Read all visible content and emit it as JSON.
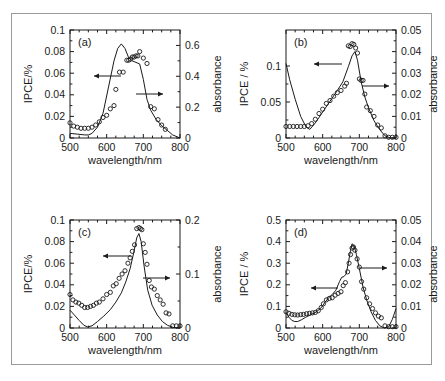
{
  "figure": {
    "kind": "multi-panel-scientific-figure",
    "panel_count": 4,
    "shared_xlabel": "wavelength/nm",
    "shared_xticks": [
      "500",
      "600",
      "700",
      "800"
    ],
    "marker_legend": "open circles = IPCE (left axis)",
    "line_legend": "solid curve = absorbance (right axis)"
  },
  "panels": {
    "a": {
      "letter": "(a)",
      "ylabel_left": "IPCE/%",
      "ylabel_right": "absorbance",
      "xlabel": "wavelength/nm",
      "left_ticks": [
        "0.02",
        "0.04",
        "0.06",
        "0.08",
        "0.1"
      ],
      "right_ticks": [
        "0",
        "0.2",
        "0.4",
        "0.6"
      ],
      "x_ticks": [
        "500",
        "600",
        "700",
        "800"
      ]
    },
    "b": {
      "letter": "(b)",
      "ylabel_left": "IPCE / %",
      "ylabel_right": "absorbance",
      "xlabel": "wavelength/nm",
      "left_ticks": [
        "0",
        "0.05",
        "0.1"
      ],
      "right_ticks": [
        "0",
        "0.01",
        "0.02",
        "0.03",
        "0.04",
        "0.05"
      ],
      "x_ticks": [
        "500",
        "600",
        "700",
        "800"
      ]
    },
    "c": {
      "letter": "(c)",
      "ylabel_left": "IPCE/%",
      "ylabel_right": "absorbance",
      "xlabel": "wavelength/nm",
      "left_ticks": [
        "0",
        "0.02",
        "0.04",
        "0.06",
        "0.08",
        "0.1"
      ],
      "right_ticks": [
        "0",
        "0.1",
        "0.2"
      ],
      "x_ticks": [
        "500",
        "600",
        "700",
        "800"
      ]
    },
    "d": {
      "letter": "(d)",
      "ylabel_left": "IPCE / %",
      "ylabel_right": "absorbance",
      "xlabel": "wavelength/nm",
      "left_ticks": [
        "0",
        "0.1",
        "0.2",
        "0.3",
        "0.4",
        "0.5"
      ],
      "right_ticks": [
        "0",
        "0.01",
        "0.02",
        "0.03",
        "0.04",
        "0.05"
      ],
      "x_ticks": [
        "500",
        "600",
        "700",
        "800"
      ]
    }
  },
  "chart_data": [
    {
      "id": "panel-a",
      "type": "scatter",
      "title": "(a)",
      "xlabel": "wavelength/nm",
      "ylabel": "IPCE/%",
      "ylabel_secondary": "absorbance",
      "xlim": [
        500,
        800
      ],
      "ylim": [
        0,
        0.1
      ],
      "ylim_secondary": [
        0,
        0.7
      ],
      "xticks": [
        500,
        600,
        700,
        800
      ],
      "yticks": [
        0,
        0.02,
        0.04,
        0.06,
        0.08,
        0.1
      ],
      "yticks_secondary": [
        0,
        0.2,
        0.4,
        0.6
      ],
      "grid": false,
      "legend": "none",
      "annotations": [
        {
          "text": "left-arrow to IPCE axis",
          "points_to": "left"
        },
        {
          "text": "right-arrow to absorbance axis",
          "points_to": "right"
        }
      ],
      "series": [
        {
          "name": "IPCE",
          "axis": "left",
          "style": "open-circle-markers",
          "x": [
            500,
            510,
            520,
            530,
            540,
            550,
            560,
            570,
            580,
            590,
            600,
            610,
            620,
            625,
            635,
            645,
            655,
            660,
            665,
            670,
            675,
            680,
            685,
            690,
            700,
            710,
            720,
            730,
            740,
            750,
            760
          ],
          "y": [
            0.014,
            0.011,
            0.01,
            0.009,
            0.009,
            0.009,
            0.01,
            0.012,
            0.015,
            0.019,
            0.021,
            0.027,
            0.03,
            0.045,
            0.061,
            0.061,
            0.072,
            0.072,
            0.073,
            0.075,
            0.075,
            0.076,
            0.076,
            0.08,
            0.074,
            0.069,
            0.029,
            0.027,
            0.017,
            0.012,
            0.008
          ]
        },
        {
          "name": "absorbance",
          "axis": "right",
          "style": "solid-line",
          "x": [
            500,
            520,
            540,
            550,
            560,
            575,
            590,
            605,
            620,
            630,
            640,
            650,
            660,
            670,
            680,
            690,
            700,
            710,
            720,
            735,
            750,
            765,
            780,
            800
          ],
          "y": [
            0.03,
            0.025,
            0.02,
            0.02,
            0.03,
            0.07,
            0.16,
            0.33,
            0.5,
            0.58,
            0.61,
            0.58,
            0.52,
            0.5,
            0.49,
            0.48,
            0.38,
            0.25,
            0.18,
            0.12,
            0.08,
            0.05,
            0.02,
            0.0
          ]
        }
      ]
    },
    {
      "id": "panel-b",
      "type": "scatter",
      "title": "(b)",
      "xlabel": "wavelength/nm",
      "ylabel": "IPCE / %",
      "ylabel_secondary": "absorbance",
      "xlim": [
        500,
        800
      ],
      "ylim": [
        0,
        0.15
      ],
      "ylim_secondary": [
        0,
        0.05
      ],
      "xticks": [
        500,
        600,
        700,
        800
      ],
      "yticks": [
        0,
        0.05,
        0.1
      ],
      "yticks_secondary": [
        0,
        0.01,
        0.02,
        0.03,
        0.04,
        0.05
      ],
      "grid": false,
      "legend": "none",
      "annotations": [
        {
          "text": "left-arrow to IPCE axis",
          "points_to": "left"
        },
        {
          "text": "right-arrow to absorbance axis",
          "points_to": "right"
        }
      ],
      "series": [
        {
          "name": "IPCE",
          "axis": "left",
          "style": "open-circle-markers",
          "x": [
            500,
            510,
            520,
            530,
            540,
            550,
            560,
            570,
            580,
            590,
            600,
            610,
            620,
            630,
            640,
            650,
            660,
            665,
            670,
            675,
            680,
            685,
            690,
            695,
            700,
            705,
            710,
            715,
            720,
            730,
            740,
            750,
            760,
            770,
            780,
            790,
            800
          ],
          "y": [
            0.016,
            0.016,
            0.016,
            0.016,
            0.016,
            0.016,
            0.017,
            0.02,
            0.026,
            0.034,
            0.04,
            0.048,
            0.052,
            0.058,
            0.063,
            0.066,
            0.072,
            0.076,
            0.128,
            0.127,
            0.131,
            0.13,
            0.125,
            0.118,
            0.082,
            0.08,
            0.08,
            0.061,
            0.043,
            0.038,
            0.03,
            0.018,
            0.014,
            0.003,
            0.001,
            0.001,
            0.001
          ]
        },
        {
          "name": "absorbance",
          "axis": "right",
          "style": "solid-line",
          "x": [
            500,
            510,
            525,
            540,
            555,
            565,
            580,
            600,
            620,
            640,
            655,
            670,
            680,
            688,
            695,
            705,
            715,
            725,
            740,
            755,
            770,
            785,
            800
          ],
          "y": [
            0.0345,
            0.027,
            0.018,
            0.01,
            0.005,
            0.004,
            0.007,
            0.012,
            0.017,
            0.022,
            0.026,
            0.033,
            0.038,
            0.04,
            0.036,
            0.026,
            0.019,
            0.014,
            0.008,
            0.004,
            0.001,
            0.0,
            0.0
          ]
        }
      ]
    },
    {
      "id": "panel-c",
      "type": "scatter",
      "title": "(c)",
      "xlabel": "wavelength/nm",
      "ylabel": "IPCE/%",
      "ylabel_secondary": "absorbance",
      "xlim": [
        500,
        800
      ],
      "ylim": [
        0,
        0.1
      ],
      "ylim_secondary": [
        0,
        0.2
      ],
      "xticks": [
        500,
        600,
        700,
        800
      ],
      "yticks": [
        0,
        0.02,
        0.04,
        0.06,
        0.08,
        0.1
      ],
      "yticks_secondary": [
        0,
        0.1,
        0.2
      ],
      "grid": false,
      "legend": "none",
      "annotations": [
        {
          "text": "left-arrow to IPCE axis",
          "points_to": "left"
        },
        {
          "text": "right-arrow to absorbance axis",
          "points_to": "right"
        }
      ],
      "series": [
        {
          "name": "IPCE",
          "axis": "left",
          "style": "open-circle-markers",
          "x": [
            500,
            508,
            516,
            524,
            532,
            540,
            548,
            556,
            564,
            572,
            580,
            590,
            600,
            610,
            618,
            626,
            634,
            642,
            650,
            658,
            664,
            670,
            676,
            682,
            688,
            692,
            696,
            700,
            705,
            710,
            716,
            722,
            730,
            738,
            746,
            754,
            762,
            770,
            780,
            790,
            800
          ],
          "y": [
            0.031,
            0.026,
            0.024,
            0.023,
            0.021,
            0.019,
            0.019,
            0.02,
            0.021,
            0.023,
            0.024,
            0.027,
            0.031,
            0.033,
            0.039,
            0.041,
            0.046,
            0.05,
            0.053,
            0.06,
            0.065,
            0.071,
            0.077,
            0.092,
            0.093,
            0.092,
            0.091,
            0.078,
            0.07,
            0.059,
            0.044,
            0.038,
            0.036,
            0.03,
            0.026,
            0.022,
            0.014,
            0.013,
            0.002,
            0.002,
            0.002
          ]
        },
        {
          "name": "absorbance",
          "axis": "right",
          "style": "solid-line",
          "x": [
            500,
            512,
            525,
            538,
            548,
            560,
            575,
            592,
            610,
            625,
            640,
            652,
            664,
            674,
            682,
            688,
            694,
            702,
            712,
            724,
            738,
            752,
            766,
            782,
            800
          ],
          "y": [
            0.033,
            0.024,
            0.014,
            0.005,
            0.002,
            0.004,
            0.012,
            0.022,
            0.034,
            0.048,
            0.065,
            0.085,
            0.11,
            0.14,
            0.167,
            0.175,
            0.16,
            0.115,
            0.07,
            0.042,
            0.024,
            0.012,
            0.005,
            0.001,
            0.0
          ]
        }
      ]
    },
    {
      "id": "panel-d",
      "type": "scatter",
      "title": "(d)",
      "xlabel": "wavelength/nm",
      "ylabel": "IPCE / %",
      "ylabel_secondary": "absorbance",
      "xlim": [
        500,
        800
      ],
      "ylim": [
        0,
        0.5
      ],
      "ylim_secondary": [
        0,
        0.05
      ],
      "xticks": [
        500,
        600,
        700,
        800
      ],
      "yticks": [
        0,
        0.1,
        0.2,
        0.3,
        0.4,
        0.5
      ],
      "yticks_secondary": [
        0,
        0.01,
        0.02,
        0.03,
        0.04,
        0.05
      ],
      "grid": false,
      "legend": "none",
      "annotations": [
        {
          "text": "left-arrow to IPCE axis",
          "points_to": "left"
        },
        {
          "text": "right-arrow to absorbance axis",
          "points_to": "right"
        }
      ],
      "series": [
        {
          "name": "IPCE",
          "axis": "left",
          "style": "open-circle-markers",
          "x": [
            500,
            508,
            516,
            524,
            532,
            540,
            548,
            556,
            564,
            572,
            580,
            588,
            596,
            602,
            610,
            618,
            626,
            634,
            642,
            650,
            656,
            662,
            668,
            672,
            676,
            680,
            684,
            688,
            694,
            700,
            706,
            712,
            720,
            728,
            736,
            744,
            752,
            760,
            770,
            780,
            790,
            800
          ],
          "y": [
            0.075,
            0.068,
            0.063,
            0.061,
            0.06,
            0.062,
            0.063,
            0.066,
            0.068,
            0.07,
            0.072,
            0.08,
            0.095,
            0.112,
            0.13,
            0.137,
            0.14,
            0.152,
            0.16,
            0.168,
            0.196,
            0.21,
            0.26,
            0.3,
            0.34,
            0.37,
            0.375,
            0.36,
            0.32,
            0.282,
            0.215,
            0.18,
            0.14,
            0.112,
            0.09,
            0.07,
            0.055,
            0.047,
            0.01,
            0.006,
            0.006,
            0.006
          ]
        },
        {
          "name": "absorbance",
          "axis": "right",
          "style": "solid-line",
          "x": [
            500,
            508,
            516,
            524,
            532,
            542,
            554,
            568,
            582,
            594,
            606,
            616,
            626,
            636,
            646,
            652,
            658,
            664,
            670,
            676,
            680,
            686,
            692,
            700,
            710,
            720,
            732,
            744,
            756,
            768,
            780,
            790,
            800
          ],
          "y": [
            0.0072,
            0.005,
            0.0035,
            0.003,
            0.003,
            0.0038,
            0.005,
            0.0062,
            0.0074,
            0.009,
            0.0118,
            0.014,
            0.0155,
            0.0175,
            0.0215,
            0.0235,
            0.0238,
            0.025,
            0.03,
            0.036,
            0.039,
            0.038,
            0.034,
            0.0275,
            0.019,
            0.013,
            0.0075,
            0.0035,
            0.001,
            0.0,
            0.0005,
            0.004,
            0.009
          ]
        }
      ]
    }
  ]
}
